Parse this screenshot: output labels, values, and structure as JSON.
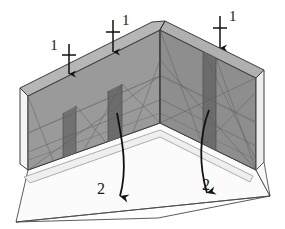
{
  "figure": {
    "background_color": "#ffffff",
    "width": 285,
    "height": 229
  },
  "colors": {
    "wall_face": "#9a9a9a",
    "wall_face_right": "#8f8f8f",
    "pier_band": "#6e6e6e",
    "wall_top_edge": "#b4b4b4",
    "wall_end_face": "#f4f4f4",
    "floor_slab": "#fdfdfd",
    "outline": "#3c3c3c",
    "mesh_line": "#5a5a5a",
    "arrow": "#111111",
    "label": "#1a1a1a"
  },
  "labels": {
    "load_label": "1",
    "rotation_label": "2"
  },
  "load_arrows": [
    {
      "id": "load-arrow-left",
      "label": "1",
      "label_x": 60,
      "label_y": 50,
      "label_side": "left",
      "shaft_x": 69,
      "shaft_top": 44,
      "shaft_bottom": 76,
      "tick_y": 55
    },
    {
      "id": "load-arrow-middle",
      "label": "1",
      "label_x": 119,
      "label_y": 26,
      "label_side": "right",
      "shaft_x": 113,
      "shaft_top": 20,
      "shaft_bottom": 54,
      "tick_y": 32
    },
    {
      "id": "load-arrow-right",
      "label": "1",
      "label_x": 228,
      "label_y": 22,
      "label_side": "right",
      "shaft_x": 220,
      "shaft_top": 16,
      "shaft_bottom": 50,
      "tick_y": 28
    }
  ],
  "rotation_arrows": [
    {
      "id": "rotation-arrow-left",
      "label": "2",
      "label_x": 100,
      "label_y": 192,
      "start_x": 117,
      "start_y": 113,
      "end_x": 116,
      "end_y": 208
    },
    {
      "id": "rotation-arrow-right",
      "label": "2",
      "label_x": 205,
      "label_y": 188,
      "start_x": 208,
      "start_y": 110,
      "end_x": 207,
      "end_y": 205
    }
  ],
  "geometry": {
    "apex_top": {
      "x": 165,
      "y": 21
    },
    "apex_inner": {
      "x": 160,
      "y": 123
    },
    "left_wall_top_far": {
      "x": 20,
      "y": 88
    },
    "right_wall_top_far": {
      "x": 264,
      "y": 70
    },
    "floor_left": {
      "x": 16,
      "y": 222
    },
    "floor_right": {
      "x": 270,
      "y": 196
    }
  },
  "piers": {
    "count": 3,
    "description": "dark vertical bands on wall faces under load arrows"
  },
  "annotations": {
    "view": "isometric",
    "element_type": "L-shaped corner wall with floor slab"
  }
}
